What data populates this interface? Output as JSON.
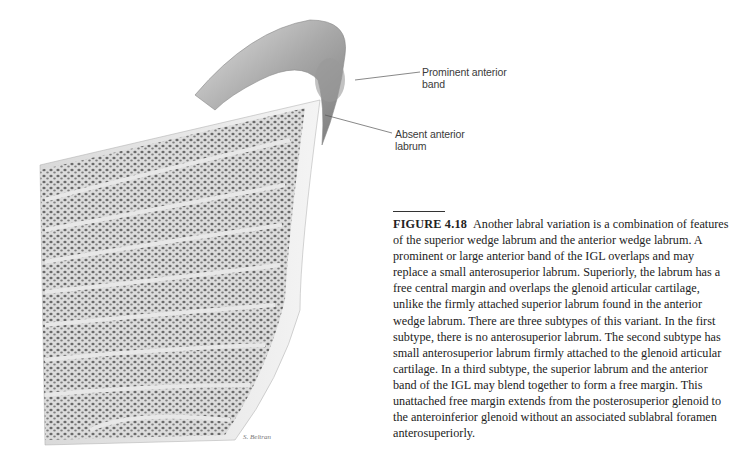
{
  "figure": {
    "labels": {
      "prominent_anterior_band": [
        "Prominent anterior",
        "band"
      ],
      "absent_anterior_labrum": [
        "Absent anterior",
        "labrum"
      ]
    },
    "caption": {
      "figure_number": "FIGURE 4.18",
      "text": "Another labral variation is a combination of features of the superior wedge labrum and the anterior wedge labrum. A prominent or large anterior band of the IGL overlaps and may replace a small anterosuperior labrum. Superiorly, the labrum has a free central margin and overlaps the glenoid articular cartilage, unlike the firmly attached superior labrum found in the anterior wedge labrum. There are three subtypes of this variant. In the first subtype, there is no anterosuperior labrum. The second subtype has small anterosuperior labrum firmly attached to the glenoid articular cartilage. In a third subtype, the superior labrum and the anterior band of the IGL may blend together to form a free margin. This unattached free margin extends from the posterosuperior glenoid to the anteroinferior glenoid without an associated sublabral foramen anterosuperiorly."
    },
    "artist_signature": "S. Beltran"
  }
}
